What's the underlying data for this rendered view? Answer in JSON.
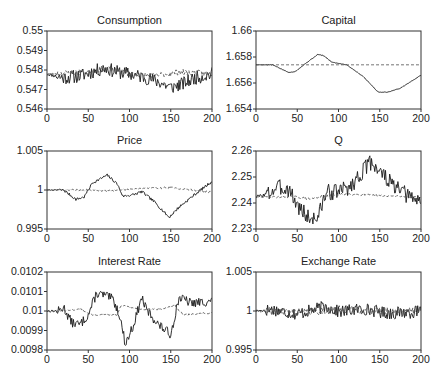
{
  "chart_data": [
    {
      "id": "consumption",
      "type": "line",
      "title": "Consumption",
      "xlabel": "",
      "ylabel": "",
      "xlim": [
        0,
        200
      ],
      "ylim": [
        0.546,
        0.55
      ],
      "xticks": [
        "0",
        "50",
        "100",
        "150",
        "200"
      ],
      "yticks": [
        "0.55",
        "0.549",
        "0.548",
        "0.547",
        "0.546"
      ],
      "grid": false,
      "series": [
        {
          "name": "solid",
          "style": "solid",
          "keyframes": [
            [
              0,
              0.5478
            ],
            [
              20,
              0.5476
            ],
            [
              40,
              0.5477
            ],
            [
              55,
              0.5479
            ],
            [
              70,
              0.5481
            ],
            [
              85,
              0.5479
            ],
            [
              100,
              0.5478
            ],
            [
              120,
              0.5476
            ],
            [
              135,
              0.5474
            ],
            [
              150,
              0.5471
            ],
            [
              165,
              0.5473
            ],
            [
              180,
              0.5476
            ],
            [
              200,
              0.5478
            ]
          ],
          "noise": 0.00035,
          "seed": 11
        },
        {
          "name": "dashed",
          "style": "dashed",
          "keyframes": [
            [
              0,
              0.5478
            ],
            [
              50,
              0.5479
            ],
            [
              70,
              0.5481
            ],
            [
              100,
              0.5478
            ],
            [
              130,
              0.5477
            ],
            [
              160,
              0.5479
            ],
            [
              200,
              0.5478
            ]
          ],
          "noise": 0.00015,
          "seed": 23
        }
      ]
    },
    {
      "id": "capital",
      "type": "line",
      "title": "Capital",
      "xlabel": "",
      "ylabel": "",
      "xlim": [
        0,
        200
      ],
      "ylim": [
        1.654,
        1.66
      ],
      "xticks": [
        "0",
        "50",
        "100",
        "150",
        "200"
      ],
      "yticks": [
        "1.66",
        "1.658",
        "1.656",
        "1.654"
      ],
      "grid": false,
      "series": [
        {
          "name": "solid",
          "style": "solid",
          "keyframes": [
            [
              0,
              1.6574
            ],
            [
              20,
              1.6574
            ],
            [
              30,
              1.6571
            ],
            [
              40,
              1.6568
            ],
            [
              48,
              1.6569
            ],
            [
              60,
              1.6575
            ],
            [
              75,
              1.6582
            ],
            [
              82,
              1.6581
            ],
            [
              92,
              1.6576
            ],
            [
              110,
              1.6574
            ],
            [
              130,
              1.6565
            ],
            [
              148,
              1.6553
            ],
            [
              160,
              1.6553
            ],
            [
              175,
              1.6556
            ],
            [
              200,
              1.6566
            ]
          ],
          "noise": 2e-05,
          "seed": 5
        },
        {
          "name": "dashed",
          "style": "dashed",
          "keyframes": [
            [
              0,
              1.6574
            ],
            [
              200,
              1.6574
            ]
          ],
          "noise": 0,
          "seed": 1
        }
      ]
    },
    {
      "id": "price",
      "type": "line",
      "title": "Price",
      "xlabel": "",
      "ylabel": "",
      "xlim": [
        0,
        200
      ],
      "ylim": [
        0.995,
        1.005
      ],
      "xticks": [
        "0",
        "50",
        "100",
        "150",
        "200"
      ],
      "yticks": [
        "1.005",
        "1",
        "0.995"
      ],
      "grid": false,
      "series": [
        {
          "name": "solid",
          "style": "solid",
          "keyframes": [
            [
              0,
              1.0
            ],
            [
              20,
              1.0
            ],
            [
              35,
              0.9988
            ],
            [
              45,
              0.9991
            ],
            [
              55,
              1.0009
            ],
            [
              73,
              1.0019
            ],
            [
              85,
              1.0008
            ],
            [
              92,
              0.9992
            ],
            [
              105,
              0.9994
            ],
            [
              115,
              0.9998
            ],
            [
              130,
              0.9985
            ],
            [
              148,
              0.9965
            ],
            [
              160,
              0.9978
            ],
            [
              180,
              0.9995
            ],
            [
              200,
              1.0011
            ]
          ],
          "noise": 0.00018,
          "seed": 7
        },
        {
          "name": "dashed",
          "style": "dashed",
          "keyframes": [
            [
              0,
              1.0
            ],
            [
              50,
              1.0
            ],
            [
              75,
              0.9999
            ],
            [
              110,
              1.0002
            ],
            [
              150,
              1.0003
            ],
            [
              200,
              0.9997
            ]
          ],
          "noise": 0.00012,
          "seed": 19
        }
      ]
    },
    {
      "id": "q",
      "type": "line",
      "title": "Q",
      "xlabel": "",
      "ylabel": "",
      "xlim": [
        0,
        200
      ],
      "ylim": [
        2.23,
        2.26
      ],
      "xticks": [
        "0",
        "50",
        "100",
        "150",
        "200"
      ],
      "yticks": [
        "2.26",
        "2.25",
        "2.24",
        "2.23"
      ],
      "grid": false,
      "series": [
        {
          "name": "solid",
          "style": "solid",
          "keyframes": [
            [
              0,
              2.2423
            ],
            [
              15,
              2.2435
            ],
            [
              25,
              2.246
            ],
            [
              40,
              2.2455
            ],
            [
              50,
              2.239
            ],
            [
              65,
              2.234
            ],
            [
              75,
              2.2345
            ],
            [
              85,
              2.244
            ],
            [
              100,
              2.2445
            ],
            [
              115,
              2.2465
            ],
            [
              130,
              2.2525
            ],
            [
              140,
              2.256
            ],
            [
              155,
              2.2505
            ],
            [
              170,
              2.2455
            ],
            [
              185,
              2.2425
            ],
            [
              200,
              2.2405
            ]
          ],
          "noise": 0.0032,
          "seed": 3
        },
        {
          "name": "dashed",
          "style": "dashed",
          "keyframes": [
            [
              0,
              2.2423
            ],
            [
              50,
              2.2423
            ],
            [
              65,
              2.2415
            ],
            [
              80,
              2.2425
            ],
            [
              110,
              2.2435
            ],
            [
              150,
              2.2428
            ],
            [
              200,
              2.2423
            ]
          ],
          "noise": 0.0004,
          "seed": 29
        }
      ]
    },
    {
      "id": "interest-rate",
      "type": "line",
      "title": "Interest Rate",
      "xlabel": "",
      "ylabel": "",
      "xlim": [
        0,
        200
      ],
      "ylim": [
        0.0098,
        0.0102
      ],
      "xticks": [
        "0",
        "50",
        "100",
        "150",
        "200"
      ],
      "yticks": [
        "0.0102",
        "0.0101",
        "0.01",
        "0.0099",
        "0.0098"
      ],
      "grid": false,
      "series": [
        {
          "name": "solid",
          "style": "solid",
          "keyframes": [
            [
              0,
              0.01
            ],
            [
              15,
              0.01
            ],
            [
              20,
              0.01002
            ],
            [
              30,
              0.00994
            ],
            [
              40,
              0.00993
            ],
            [
              50,
              0.00998
            ],
            [
              60,
              0.01009
            ],
            [
              70,
              0.01008
            ],
            [
              80,
              0.01006
            ],
            [
              88,
              0.00998
            ],
            [
              95,
              0.00983
            ],
            [
              105,
              0.00993
            ],
            [
              115,
              0.01007
            ],
            [
              120,
              0.01001
            ],
            [
              135,
              0.00993
            ],
            [
              150,
              0.00988
            ],
            [
              160,
              0.01007
            ],
            [
              175,
              0.01004
            ],
            [
              200,
              0.01005
            ]
          ],
          "noise": 2.4e-05,
          "seed": 13
        },
        {
          "name": "dashed",
          "style": "dashed",
          "keyframes": [
            [
              0,
              0.01
            ],
            [
              20,
              0.01
            ],
            [
              40,
              0.01001
            ],
            [
              55,
              0.00998
            ],
            [
              85,
              0.00998
            ],
            [
              90,
              0.01003
            ],
            [
              110,
              0.01001
            ],
            [
              140,
              0.01001
            ],
            [
              155,
              0.01003
            ],
            [
              165,
              0.00998
            ],
            [
              200,
              0.00999
            ]
          ],
          "noise": 4e-06,
          "seed": 31
        }
      ]
    },
    {
      "id": "exchange-rate",
      "type": "line",
      "title": "Exchange Rate",
      "xlabel": "",
      "ylabel": "",
      "xlim": [
        0,
        200
      ],
      "ylim": [
        0.995,
        1.005
      ],
      "xticks": [
        "0",
        "50",
        "100",
        "150",
        "200"
      ],
      "yticks": [
        "1.005",
        "1",
        "0.995"
      ],
      "grid": false,
      "series": [
        {
          "name": "solid",
          "style": "solid",
          "keyframes": [
            [
              0,
              1.0
            ],
            [
              20,
              1.0002
            ],
            [
              50,
              0.9996
            ],
            [
              85,
              1.0006
            ],
            [
              100,
              0.9999
            ],
            [
              130,
              1.0003
            ],
            [
              160,
              0.9997
            ],
            [
              200,
              0.9999
            ]
          ],
          "noise": 0.0008,
          "seed": 17
        },
        {
          "name": "dashed",
          "style": "dashed",
          "keyframes": [
            [
              0,
              1.0
            ],
            [
              50,
              0.9998
            ],
            [
              100,
              1.0002
            ],
            [
              150,
              1.0
            ],
            [
              200,
              1.0
            ]
          ],
          "noise": 0.0005,
          "seed": 41
        }
      ]
    }
  ]
}
